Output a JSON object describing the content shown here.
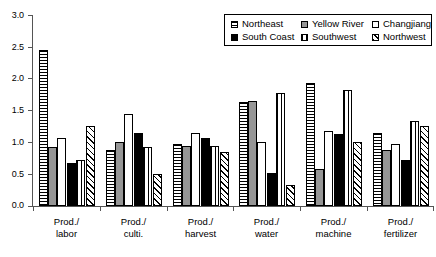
{
  "chart_data": {
    "type": "bar",
    "title": "",
    "subtitle": "",
    "xlabel": "",
    "ylabel": "",
    "ylim": [
      0,
      3.0
    ],
    "ytick_labels": [
      "0.0",
      "0.5",
      "1.0",
      "1.5",
      "2.0",
      "2.5",
      "3.0"
    ],
    "ytick_values": [
      0.0,
      0.5,
      1.0,
      1.5,
      2.0,
      2.5,
      3.0
    ],
    "grid": false,
    "legend_position": "top-right",
    "categories": [
      "Prod./labor",
      "Prod./culti.",
      "Prod./harvest",
      "Prod./water",
      "Prod./machine",
      "Prod./fertilizer"
    ],
    "category_lines": [
      [
        "Prod./",
        "labor"
      ],
      [
        "Prod./",
        "culti."
      ],
      [
        "Prod./",
        "harvest"
      ],
      [
        "Prod./",
        "water"
      ],
      [
        "Prod./",
        "machine"
      ],
      [
        "Prod./",
        "fertilizer"
      ]
    ],
    "series": [
      {
        "name": "Northeast",
        "pattern": "horizontal-lines",
        "values": [
          2.45,
          0.88,
          0.98,
          1.63,
          1.93,
          1.15
        ]
      },
      {
        "name": "Yellow River",
        "pattern": "solid-gray",
        "values": [
          0.92,
          1.0,
          0.95,
          1.65,
          0.58,
          0.88
        ]
      },
      {
        "name": "Changjiang",
        "pattern": "solid-white",
        "values": [
          1.07,
          1.45,
          1.15,
          1.0,
          1.18,
          0.97
        ]
      },
      {
        "name": "South Coast",
        "pattern": "solid-black",
        "values": [
          0.67,
          1.15,
          1.07,
          0.52,
          1.13,
          0.72
        ]
      },
      {
        "name": "Southwest",
        "pattern": "vertical-lines",
        "values": [
          0.73,
          0.93,
          0.95,
          1.78,
          1.83,
          1.33
        ]
      },
      {
        "name": "Northwest",
        "pattern": "diagonal-hatch",
        "values": [
          1.25,
          0.5,
          0.85,
          0.33,
          1.0,
          1.25
        ]
      }
    ]
  },
  "legend": {
    "items": [
      {
        "label": "Northeast",
        "pattern": "horizontal-lines"
      },
      {
        "label": "Yellow River",
        "pattern": "solid-gray"
      },
      {
        "label": "Changjiang",
        "pattern": "solid-white"
      },
      {
        "label": "South Coast",
        "pattern": "solid-black"
      },
      {
        "label": "Southwest",
        "pattern": "vertical-lines"
      },
      {
        "label": "Northwest",
        "pattern": "diagonal-hatch"
      }
    ]
  },
  "colors": {
    "axis": "#555555",
    "bar_outline": "#000000",
    "gray_fill": "#969696",
    "background": "#ffffff"
  }
}
